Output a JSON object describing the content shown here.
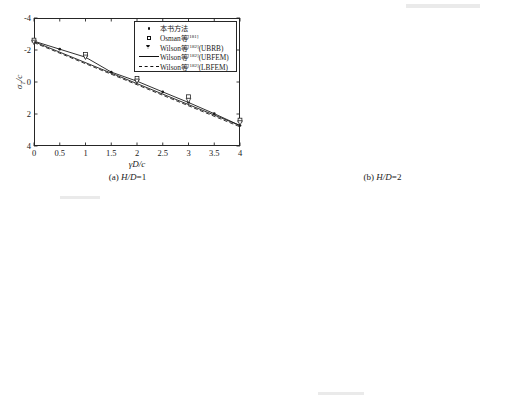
{
  "figure": {
    "background": "#ffffff",
    "line_color": "#1a1a1a",
    "axis_color": "#262626"
  },
  "legend": {
    "entries": [
      {
        "key": "filled-dot",
        "label_main": "本书方法",
        "sup": "",
        "label_tail": ""
      },
      {
        "key": "open-square",
        "label_main": "Osman等",
        "sup": "[181]",
        "label_tail": ""
      },
      {
        "key": "open-triangle",
        "label_main": "Wilson等",
        "sup": "[182]",
        "label_tail": "(UBRB)"
      },
      {
        "key": "solid-line",
        "label_main": "Wilson等",
        "sup": "[182]",
        "label_tail": "(UBFEM)"
      },
      {
        "key": "dashed-line",
        "label_main": "Wilson等",
        "sup": "[182]",
        "label_tail": "(LBFEM)"
      }
    ]
  },
  "chart_data": [
    {
      "id": "panel-a",
      "type": "line",
      "title": "",
      "caption_prefix": "(a) ",
      "caption_italic": "H/D",
      "caption_suffix": "=1",
      "xlabel": "γD/c",
      "ylabel": "σT/c",
      "xlim": [
        0,
        4
      ],
      "ylim": [
        -4,
        4
      ],
      "y_inverted": true,
      "xticks": [
        0,
        0.5,
        1,
        1.5,
        2,
        2.5,
        3,
        3.5,
        4
      ],
      "xticklabels": [
        "0",
        "0.5",
        "1",
        "1.5",
        "2",
        "2.5",
        "3",
        "3.5",
        "4"
      ],
      "yticks": [
        -4,
        -2,
        0,
        2,
        4
      ],
      "yticklabels": [
        "-4",
        "-2",
        "0",
        "2",
        "4"
      ],
      "grid": false,
      "legend_position": "top-right",
      "series": [
        {
          "name": "本书方法",
          "marker": "filled-dot",
          "x": [
            0,
            0.5,
            1,
            1.5,
            2,
            2.5,
            3,
            3.5,
            4
          ],
          "y": [
            -2.55,
            -2.05,
            -1.55,
            -0.62,
            -0.05,
            0.62,
            1.28,
            1.98,
            2.72
          ]
        },
        {
          "name": "Osman等[181]",
          "marker": "open-square",
          "x": [
            0,
            1,
            2,
            3,
            4
          ],
          "y": [
            -2.62,
            -1.72,
            -0.22,
            0.92,
            2.38
          ]
        },
        {
          "name": "Wilson等[182](UBRB)",
          "marker": "open-triangle",
          "x": [
            0,
            1,
            2,
            3,
            4
          ],
          "y": [
            -2.48,
            -1.55,
            -0.05,
            1.15,
            2.55
          ]
        },
        {
          "name": "Wilson等[182](UBFEM)",
          "marker": "solid-line",
          "x": [
            0,
            4
          ],
          "y": [
            -2.52,
            2.72
          ]
        },
        {
          "name": "Wilson等[182](LBFEM)",
          "marker": "dashed-line",
          "x": [
            0,
            4
          ],
          "y": [
            -2.46,
            2.8
          ]
        }
      ]
    },
    {
      "id": "panel-b",
      "type": "line",
      "title": "",
      "caption_prefix": "(b) ",
      "caption_italic": "H/D",
      "caption_suffix": "=2",
      "xlabel": "γD/c",
      "ylabel": "σT/c",
      "xlim": [
        0,
        4
      ],
      "ylim": [
        -5,
        7
      ],
      "y_inverted": true,
      "xticks": [
        0,
        0.5,
        1,
        1.5,
        2,
        2.5,
        3,
        3.5,
        4
      ],
      "xticklabels": [
        "0",
        "0.5",
        "1",
        "1.5",
        "2",
        "2.5",
        "3",
        "3.5",
        "4"
      ],
      "yticks": [
        -5,
        -3,
        -1,
        1,
        3,
        5,
        7
      ],
      "yticklabels": [
        "-5",
        "-3",
        "-1",
        "1",
        "3",
        "5",
        "7"
      ],
      "grid": false,
      "legend_position": "top-right",
      "series": [
        {
          "name": "本书方法",
          "marker": "filled-dot",
          "x": [
            0,
            0.5,
            1,
            1.5,
            2,
            2.5,
            3,
            3.5,
            4
          ],
          "y": [
            -3.42,
            -2.58,
            -1.72,
            -0.78,
            0.18,
            1.22,
            2.32,
            3.48,
            4.68
          ]
        },
        {
          "name": "Osman等[181]",
          "marker": "open-square",
          "x": [
            0,
            1,
            2,
            3,
            4
          ],
          "y": [
            -3.48,
            -1.8,
            0.32,
            2.58,
            4.92
          ]
        },
        {
          "name": "Wilson等[182](UBRB)",
          "marker": "open-triangle",
          "x": [
            0,
            1,
            2,
            3,
            4
          ],
          "y": [
            -3.35,
            -1.65,
            0.12,
            2.18,
            4.55
          ]
        },
        {
          "name": "Wilson等[182](UBFEM)",
          "marker": "solid-line",
          "x": [
            0,
            4
          ],
          "y": [
            -3.4,
            4.7
          ]
        },
        {
          "name": "Wilson等[182](LBFEM)",
          "marker": "dashed-line",
          "x": [
            0,
            4
          ],
          "y": [
            -3.32,
            4.82
          ]
        }
      ]
    },
    {
      "id": "panel-c",
      "type": "line",
      "title": "",
      "caption_prefix": "(c) ",
      "caption_italic": "H/D",
      "caption_suffix": "=3",
      "xlabel": "γD/c",
      "ylabel": "σT/c",
      "xlim": [
        0,
        4
      ],
      "ylim": [
        -6,
        12
      ],
      "y_inverted": true,
      "xticks": [
        0,
        0.5,
        1,
        1.5,
        2,
        2.5,
        3,
        3.5,
        4
      ],
      "xticklabels": [
        "0",
        "0.5",
        "1",
        "1.5",
        "2",
        "2.5",
        "3",
        "3.5",
        "4"
      ],
      "yticks": [
        -6,
        -3,
        0,
        3,
        6,
        9,
        12
      ],
      "yticklabels": [
        "-6",
        "-3",
        "0",
        "3",
        "6",
        "9",
        "12"
      ],
      "grid": false,
      "legend_position": "top-right",
      "series": [
        {
          "name": "本书方法",
          "marker": "filled-dot",
          "x": [
            0,
            0.5,
            1,
            1.5,
            2,
            2.5,
            3,
            3.5,
            4
          ],
          "y": [
            -4.45,
            -3.28,
            -2.05,
            -0.72,
            0.62,
            2.05,
            3.55,
            5.12,
            6.78
          ]
        },
        {
          "name": "Osman等[181]",
          "marker": "open-square",
          "x": [
            0,
            1,
            2,
            3,
            4
          ],
          "y": [
            -4.52,
            -2.18,
            0.35,
            3.08,
            6.38
          ]
        },
        {
          "name": "Wilson等[182](UBRB)",
          "marker": "open-triangle",
          "x": [
            0,
            1,
            2,
            3,
            4
          ],
          "y": [
            -4.38,
            -2.0,
            0.58,
            3.35,
            6.58
          ]
        },
        {
          "name": "Wilson等[182](UBFEM)",
          "marker": "solid-line",
          "x": [
            0,
            4
          ],
          "y": [
            -4.42,
            6.8
          ]
        },
        {
          "name": "Wilson等[182](LBFEM)",
          "marker": "dashed-line",
          "x": [
            0,
            4
          ],
          "y": [
            -4.3,
            7.05
          ]
        }
      ]
    },
    {
      "id": "panel-d",
      "type": "line",
      "title": "",
      "caption_prefix": "(d) ",
      "caption_italic": "H/D",
      "caption_suffix": "=4",
      "xlabel": "γD/c",
      "ylabel": "σT/c",
      "xlim": [
        0,
        4
      ],
      "ylim": [
        -8,
        16
      ],
      "y_inverted": true,
      "xticks": [
        0,
        0.5,
        1,
        1.5,
        2,
        2.5,
        3,
        3.5,
        4
      ],
      "xticklabels": [
        "0",
        "0.5",
        "1",
        "1.5",
        "2",
        "2.5",
        "3",
        "3.5",
        "4"
      ],
      "yticks": [
        -8,
        -4,
        0,
        4,
        8,
        12,
        16
      ],
      "yticklabels": [
        "-8",
        "-4",
        "0",
        "4",
        "8",
        "12",
        "16"
      ],
      "grid": false,
      "legend_position": "top-right",
      "series": [
        {
          "name": "本书方法",
          "marker": "filled-dot",
          "x": [
            0,
            0.5,
            1,
            1.5,
            2,
            2.5,
            3,
            3.5,
            4
          ],
          "y": [
            -5.15,
            -3.55,
            -1.95,
            -0.25,
            1.52,
            3.38,
            5.32,
            7.35,
            9.45
          ]
        },
        {
          "name": "Osman等[181]",
          "marker": "open-square",
          "x": [
            0,
            1,
            2,
            3,
            4
          ],
          "y": [
            -5.2,
            -2.1,
            1.2,
            4.75,
            8.95
          ]
        },
        {
          "name": "Wilson等[182](UBRB)",
          "marker": "open-triangle",
          "x": [
            0,
            1,
            2,
            3,
            4
          ],
          "y": [
            -5.05,
            -1.92,
            1.4,
            5.02,
            9.2
          ]
        },
        {
          "name": "Wilson等[182](UBFEM)",
          "marker": "solid-line",
          "x": [
            0,
            4
          ],
          "y": [
            -5.1,
            9.4
          ]
        },
        {
          "name": "Wilson等[182](LBFEM)",
          "marker": "dashed-line",
          "x": [
            0,
            4
          ],
          "y": [
            -4.92,
            10.05
          ]
        }
      ]
    }
  ]
}
